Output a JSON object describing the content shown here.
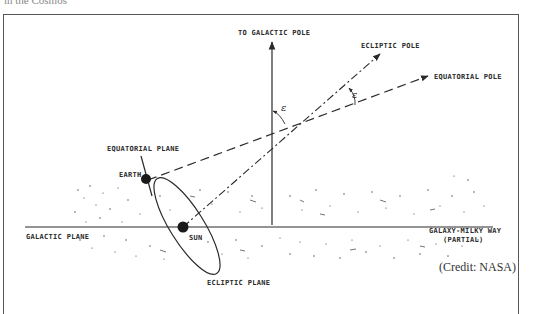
{
  "page": {
    "top_caption": "in the Cosmos"
  },
  "diagram": {
    "labels": {
      "galactic_pole": "TO GALACTIC POLE",
      "ecliptic_pole": "ECLIPTIC POLE",
      "equatorial_pole": "EQUATORIAL POLE",
      "equatorial_plane": "EQUATORIAL PLANE",
      "earth": "EARTH",
      "sun": "SUN",
      "galactic_plane": "GALACTIC PLANE",
      "galaxy_line1": "GALAXY-MILKY WAY",
      "galaxy_line2": "(PARTIAL)",
      "ecliptic_plane": "ECLIPTIC PLANE",
      "angle_epsilon_upper": "ε",
      "angle_epsilon_lower": "ε",
      "credit": "(Credit: NASA)"
    },
    "colors": {
      "ink": "#2a2a2a",
      "frame": "#555555",
      "background": "#ffffff"
    }
  }
}
